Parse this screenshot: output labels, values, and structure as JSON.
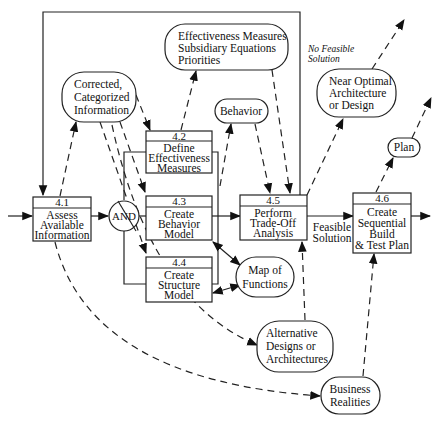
{
  "diagram": {
    "type": "functional flow / data flow diagram",
    "functions": [
      {
        "id": "4.1",
        "lines": [
          "Assess",
          "Available",
          "Information"
        ]
      },
      {
        "id": "4.2",
        "lines": [
          "Define",
          "Effectiveness",
          "Measures"
        ]
      },
      {
        "id": "4.3",
        "lines": [
          "Create",
          "Behavior",
          "Model"
        ]
      },
      {
        "id": "4.4",
        "lines": [
          "Create",
          "Structure",
          "Model"
        ]
      },
      {
        "id": "4.5",
        "lines": [
          "Perform",
          "Trade-Off",
          "Analysis"
        ]
      },
      {
        "id": "4.6",
        "lines": [
          "Create",
          "Sequential",
          "Build",
          "& Test Plan"
        ]
      }
    ],
    "gate": {
      "label": "AND"
    },
    "data_items": [
      {
        "key": "corrected",
        "lines": [
          "Corrected,",
          "Categorized",
          "Information"
        ]
      },
      {
        "key": "effectiveness",
        "lines": [
          "Effectiveness Measures",
          "Subsidiary Equations",
          "Priorities"
        ]
      },
      {
        "key": "behavior",
        "lines": [
          "Behavior"
        ]
      },
      {
        "key": "near_optimal",
        "lines": [
          "Near Optimal",
          "Architecture",
          "or Design"
        ]
      },
      {
        "key": "plan",
        "lines": [
          "Plan"
        ]
      },
      {
        "key": "map_functions",
        "lines": [
          "Map of",
          "Functions"
        ]
      },
      {
        "key": "alternative",
        "lines": [
          "Alternative",
          "Designs or",
          "Architectures"
        ]
      },
      {
        "key": "business",
        "lines": [
          "Business",
          "Realities"
        ]
      }
    ],
    "edge_labels": {
      "no_feasible": [
        "No Feasible",
        "Solution"
      ],
      "feasible": [
        "Feasible",
        "Solution"
      ]
    }
  }
}
